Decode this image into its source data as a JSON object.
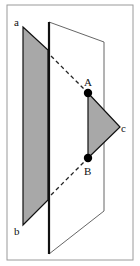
{
  "diagram": {
    "type": "geometry-plane-intersection",
    "labels": {
      "a": "a",
      "b": "b",
      "c": "c",
      "A": "A",
      "B": "B"
    },
    "colors": {
      "frame": "#9a9a9a",
      "plane_fill": "#ffffff",
      "plane_edge": "#111111",
      "triangle_fill": "#a8a8a8",
      "dashed": "#222222"
    }
  }
}
